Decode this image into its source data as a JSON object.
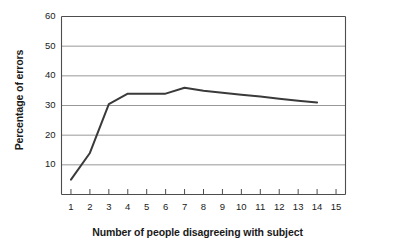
{
  "chart_data": {
    "type": "line",
    "title": "",
    "xlabel": "Number of people disagreeing with subject",
    "ylabel": "Percentage of errors",
    "x": [
      1,
      2,
      3,
      4,
      5,
      6,
      7,
      8,
      9,
      10,
      11,
      12,
      13,
      14
    ],
    "values": [
      5,
      14,
      30.5,
      34,
      34,
      34,
      36,
      35,
      34.3,
      33.6,
      33,
      32.3,
      31.6,
      31
    ],
    "series": [
      {
        "name": "Percentage of errors",
        "values": [
          5,
          14,
          30.5,
          34,
          34,
          34,
          36,
          35,
          34.3,
          33.6,
          33,
          32.3,
          31.6,
          31
        ]
      }
    ],
    "xlim": [
      0.5,
      15.5
    ],
    "ylim": [
      0,
      60
    ],
    "xticks": [
      "1",
      "2",
      "3",
      "4",
      "5",
      "6",
      "7",
      "8",
      "9",
      "10",
      "11",
      "12",
      "13",
      "14",
      "15"
    ],
    "yticks": [
      "10",
      "20",
      "30",
      "40",
      "50",
      "60"
    ],
    "grid": "horizontal",
    "legend": "none",
    "line_color": "#3a3a3a",
    "grid_color": "#8c8c8c",
    "axis_color": "#4d4d4d",
    "background": "#ffffff"
  }
}
